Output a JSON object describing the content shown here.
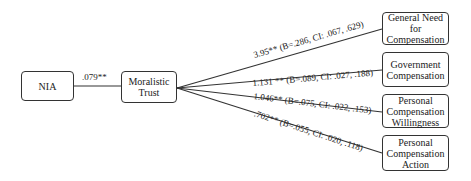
{
  "nodes": {
    "nia": "NIA",
    "moralistic_trust": "Moralistic\nTrust",
    "outcomes": [
      {
        "label": "General Need\nfor\nCompensation"
      },
      {
        "label": "Government\nCompensation"
      },
      {
        "label": "Personal\nCompensation\nWillingness"
      },
      {
        "label": "Personal\nCompensation\nAction"
      }
    ]
  },
  "edges": {
    "nia_to_trust": ".079**",
    "trust_to_outcomes": [
      "3.95** (B=.286, CI: .067, .629)",
      "1.131 ** (B=.089, CI: .027, .188)",
      "1.046** (B=.075, CI: .022, .153)",
      ".702** (B=.055, CI: .020, .118)"
    ]
  }
}
